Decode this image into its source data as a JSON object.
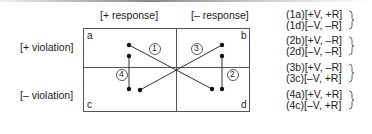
{
  "columns": {
    "plus_response": "[+ response]",
    "minus_response": "[– response]"
  },
  "rows": {
    "plus_violation": "[+ violation]",
    "minus_violation": "[– violation]"
  },
  "cells": {
    "a": "a",
    "b": "b",
    "c": "c",
    "d": "d"
  },
  "paths": {
    "p1": "1",
    "p2": "2",
    "p3": "3",
    "p4": "4"
  },
  "legend": [
    {
      "group": 1,
      "items": [
        "(1a)[+V, +R]",
        "(1d)[–V, –R]"
      ]
    },
    {
      "group": 2,
      "items": [
        "(2b)[+V, –R]",
        "(2d)[–V, –R]"
      ]
    },
    {
      "group": 3,
      "items": [
        "(3b)[+V, –R]",
        "(3c)[–V, +R]"
      ]
    },
    {
      "group": 4,
      "items": [
        "(4a)[+V, +R]",
        "(4c)[–V, +R]"
      ]
    }
  ]
}
